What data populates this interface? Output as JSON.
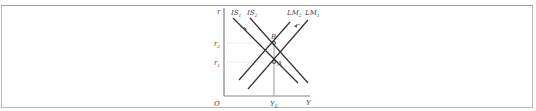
{
  "diagram": {
    "type": "IS-LM",
    "axes": {
      "y_label": "r",
      "x_label": "Y",
      "origin_label": "O",
      "y_ticks": [
        {
          "label": "r",
          "sub": "2"
        },
        {
          "label": "r",
          "sub": "1"
        }
      ],
      "x_ticks": [
        {
          "label": "Y",
          "sub": "E"
        }
      ]
    },
    "curves": [
      {
        "name": "IS",
        "sub": "1",
        "slope": "downward"
      },
      {
        "name": "IS",
        "sub": "2",
        "slope": "downward"
      },
      {
        "name": "LM",
        "sub": "2",
        "slope": "upward"
      },
      {
        "name": "LM",
        "sub": "1",
        "slope": "upward"
      }
    ],
    "points": [
      {
        "label": "B",
        "level": "r2",
        "at": "YE"
      },
      {
        "label": "A",
        "level": "r1",
        "at": "YE"
      }
    ],
    "colors": {
      "line": "#333333",
      "axis": "#666666",
      "guide": "#999999",
      "frame": "#b8b8b8"
    }
  }
}
